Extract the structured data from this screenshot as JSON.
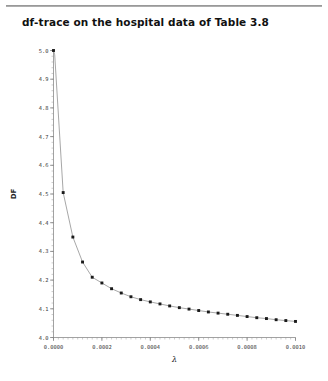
{
  "page": {
    "title_rule": true
  },
  "chart_data": {
    "type": "line",
    "title": "df-trace on the hospital data of Table 3.8",
    "xlabel": "λ",
    "ylabel": "DF",
    "xlim": [
      0.0,
      0.001
    ],
    "ylim": [
      4.0,
      5.0
    ],
    "grid": false,
    "legend": null,
    "marker": "square",
    "x_tick_labels": [
      "0.0000",
      "0.0002",
      "0.0004",
      "0.0006",
      "0.0008",
      "0.0010"
    ],
    "x_tick_values": [
      0.0,
      0.0002,
      0.0004,
      0.0006,
      0.0008,
      0.001
    ],
    "x_minor_step": 2e-05,
    "y_tick_labels": [
      "4.0",
      "4.1",
      "4.2",
      "4.3",
      "4.4",
      "4.5",
      "4.6",
      "4.7",
      "4.8",
      "4.9",
      "5.0"
    ],
    "y_tick_values": [
      4.0,
      4.1,
      4.2,
      4.3,
      4.4,
      4.5,
      4.6,
      4.7,
      4.8,
      4.9,
      5.0
    ],
    "y_minor_step": 0.02,
    "series": [
      {
        "name": "DF",
        "x": [
          0.0,
          5e-06,
          4e-05,
          8e-05,
          0.00012,
          0.00016,
          0.0002,
          0.00024,
          0.00028,
          0.00032,
          0.00036,
          0.0004,
          0.00044,
          0.00048,
          0.00052,
          0.00056,
          0.0006,
          0.00064,
          0.00068,
          0.00072,
          0.00076,
          0.0008,
          0.00084,
          0.00088,
          0.00092,
          0.00096,
          0.001
        ],
        "values": [
          5.0,
          4.985,
          4.505,
          4.35,
          4.263,
          4.21,
          4.19,
          4.17,
          4.155,
          4.142,
          4.132,
          4.124,
          4.117,
          4.11,
          4.104,
          4.099,
          4.094,
          4.089,
          4.085,
          4.081,
          4.077,
          4.073,
          4.069,
          4.066,
          4.062,
          4.059,
          4.056
        ]
      }
    ],
    "colors": {
      "line": "#8a8a8a",
      "marker": "#1a1a1a",
      "axis": "#7a7a7a",
      "text": "#3a3a3a"
    }
  }
}
